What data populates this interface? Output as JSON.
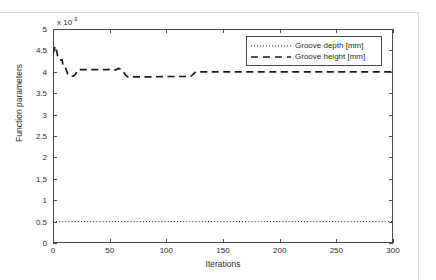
{
  "figure": {
    "axis_multiplier_prefix": "x 10",
    "axis_multiplier_exponent": "-3"
  },
  "legend": {
    "entries": [
      {
        "label": "Groove depth [mm]",
        "style": "dotted",
        "color": "#1a1a1a"
      },
      {
        "label": "Groove height [mm]",
        "style": "dashed",
        "color": "#1a1a1a"
      }
    ]
  },
  "chart_data": {
    "type": "line",
    "title": "",
    "xlabel": "Iterations",
    "ylabel": "Function parameters",
    "y_multiplier": 0.001,
    "y_multiplier_text": "x 10^-3",
    "xlim": [
      0,
      300
    ],
    "ylim": [
      0,
      5
    ],
    "xticks": [
      0,
      50,
      100,
      150,
      200,
      250,
      300
    ],
    "xticklabels": [
      "0",
      "50",
      "100",
      "150",
      "200",
      "250",
      "300"
    ],
    "yticks": [
      0,
      0.5,
      1,
      1.5,
      2,
      2.5,
      3,
      3.5,
      4,
      4.5,
      5
    ],
    "yticklabels": [
      "0",
      "0.5",
      "1",
      "1.5",
      "2",
      "2.5",
      "3",
      "3.5",
      "4",
      "4.5",
      "5"
    ],
    "grid": false,
    "legend_position": "upper right",
    "series": [
      {
        "name": "Groove depth [mm]",
        "style": "dotted",
        "color": "#1a1a1a",
        "x": [
          0,
          300
        ],
        "values": [
          0.5,
          0.5
        ]
      },
      {
        "name": "Groove height [mm]",
        "style": "dashed",
        "color": "#1a1a1a",
        "x": [
          0,
          2,
          3,
          4,
          5,
          6,
          8,
          9,
          11,
          13,
          15,
          18,
          20,
          22,
          24,
          26,
          40,
          48,
          52,
          55,
          58,
          60,
          62,
          64,
          66,
          68,
          70,
          72,
          85,
          100,
          115,
          120,
          122,
          124,
          126,
          128,
          130,
          140,
          160,
          180,
          200,
          220,
          240,
          260,
          280,
          300
        ],
        "values": [
          4.42,
          4.6,
          4.52,
          4.38,
          4.3,
          4.28,
          4.28,
          4.12,
          4.1,
          3.95,
          3.9,
          3.9,
          3.95,
          4.05,
          4.05,
          4.05,
          4.05,
          4.05,
          4.06,
          4.04,
          4.08,
          4.06,
          4.0,
          3.92,
          3.88,
          3.88,
          3.88,
          3.88,
          3.88,
          3.89,
          3.89,
          3.89,
          3.9,
          3.95,
          4.0,
          4.0,
          4.0,
          4.0,
          4.0,
          4.0,
          4.0,
          4.0,
          4.0,
          4.0,
          4.0,
          4.0
        ]
      }
    ]
  }
}
